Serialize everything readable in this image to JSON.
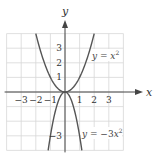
{
  "chart_data": {
    "type": "line",
    "title": "",
    "xlabel": "x",
    "ylabel": "y",
    "xlim": [
      -4,
      4
    ],
    "ylim": [
      -4,
      4
    ],
    "grid": true,
    "x_ticks": [
      -3,
      -2,
      -1,
      1,
      2,
      3
    ],
    "x_tick_labels": [
      "−3",
      "−2",
      "−1",
      "1",
      "2",
      "3"
    ],
    "y_ticks": [
      3,
      2,
      1,
      -3
    ],
    "y_tick_labels": [
      "3",
      "2",
      "1",
      "−3"
    ],
    "series": [
      {
        "name": "y = x^2",
        "label": "y = x²",
        "coef": 1,
        "x": [
          -2,
          -1.5,
          -1,
          -0.5,
          0,
          0.5,
          1,
          1.5,
          2
        ],
        "y": [
          4,
          2.25,
          1,
          0.25,
          0,
          0.25,
          1,
          2.25,
          4
        ]
      },
      {
        "name": "y = -3x^2",
        "label": "y = −3x²",
        "coef": -3,
        "x": [
          -1.155,
          -1,
          -0.5,
          0,
          0.5,
          1,
          1.155
        ],
        "y": [
          -4,
          -3,
          -0.75,
          0,
          -0.75,
          -3,
          -4
        ]
      }
    ],
    "annotations": [
      {
        "text": "y = x²",
        "x": 2.0,
        "y": 2.4
      },
      {
        "text": "y = −3x²",
        "x": 1.2,
        "y": -2.9
      }
    ]
  },
  "labels": {
    "x_axis": "x",
    "y_axis": "y",
    "eq1_y": "y",
    "eq1_eq": " = ",
    "eq1_x": "x",
    "eq1_exp": "2",
    "eq2_y": "y",
    "eq2_eq": " = −3",
    "eq2_x": "x",
    "eq2_exp": "2"
  },
  "colors": {
    "curve": "#555555",
    "grid": "#d8d8d8",
    "axis": "#444444"
  }
}
